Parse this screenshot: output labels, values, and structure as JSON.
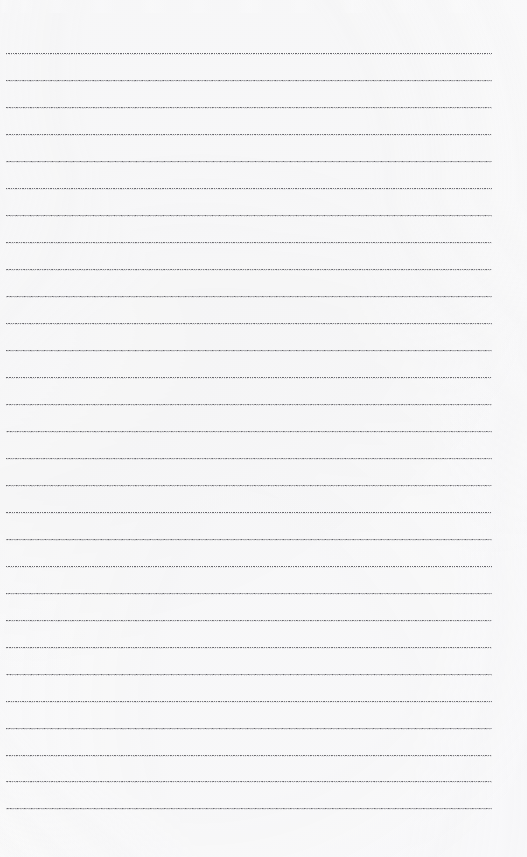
{
  "document": {
    "kind": "scanned-ruled-notebook-page",
    "page_width": 527,
    "page_height": 857,
    "background_color": "#fefefe",
    "content_text": "",
    "handwriting_present": false
  },
  "ruling": {
    "line_count": 29,
    "first_line_y": 53,
    "line_spacing": 27,
    "line_left_x": 6,
    "line_right_x": 492,
    "line_style": "dotted",
    "line_color": "#5a5a5f",
    "halo_color": "#96969e",
    "top_margin": 53,
    "bottom_margin": 49,
    "left_margin": 6,
    "right_margin": 35,
    "lines_y": [
      53,
      80,
      107,
      134,
      161,
      188,
      215,
      242,
      269,
      296,
      323,
      350,
      377,
      404,
      431,
      458,
      485,
      512,
      539,
      566,
      593,
      620,
      647,
      674,
      701,
      728,
      755,
      781,
      808
    ]
  },
  "artifacts": {
    "top_smear": {
      "present": true,
      "y": 0,
      "height": 13,
      "description": "faint illegible scanner smear across top edge",
      "legible_text": ""
    }
  }
}
